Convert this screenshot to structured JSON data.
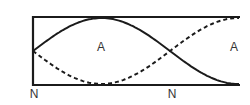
{
  "figure": {
    "background": "#ffffff",
    "line_color": "#1b1b1b",
    "text_color": "#333333",
    "box": {
      "left": 33,
      "top": 17,
      "right": 240,
      "bottom": 85
    },
    "wave": {
      "half_wavelength_px": 137,
      "amplitude_px": 33,
      "dash_pattern": "4 3"
    },
    "labels": {
      "antinode_center": "A",
      "antinode_right": "A",
      "node_left": "N",
      "node_middle": "N"
    }
  }
}
